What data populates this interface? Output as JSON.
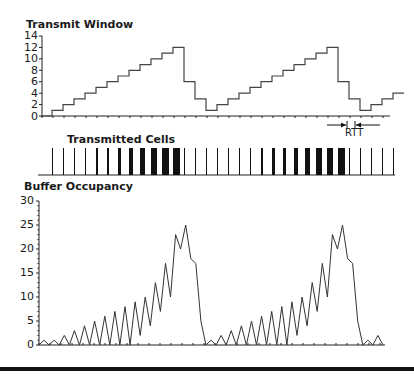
{
  "chart_data": [
    {
      "type": "line",
      "title": "Transmit Window",
      "ylabel": "",
      "xlabel": "",
      "ylim": [
        0,
        14
      ],
      "yticks": [
        0,
        2,
        4,
        6,
        8,
        10,
        12,
        14
      ],
      "series": [
        {
          "name": "Transmit Window",
          "step": true,
          "values": [
            0,
            1,
            2,
            3,
            4,
            5,
            6,
            7,
            8,
            9,
            10,
            11,
            12,
            6,
            3,
            1,
            2,
            3,
            4,
            5,
            6,
            7,
            8,
            9,
            10,
            11,
            12,
            6,
            3,
            1,
            2,
            3,
            4
          ]
        }
      ]
    },
    {
      "type": "bar",
      "title": "Transmitted Cells",
      "description": "Vertical bars representing cell transmissions; bar thickness grows with window size",
      "bar_widths": [
        1,
        1,
        1,
        1,
        2,
        2,
        3,
        4,
        5,
        6,
        7,
        7,
        1,
        1,
        1,
        1,
        1,
        1,
        1,
        2,
        3,
        3,
        4,
        5,
        6,
        6,
        7,
        1,
        1,
        1,
        1,
        1
      ]
    },
    {
      "type": "line",
      "title": "Buffer Occupancy",
      "ylim": [
        0,
        30
      ],
      "yticks": [
        0,
        5,
        10,
        15,
        20,
        25,
        30
      ],
      "series": [
        {
          "name": "Buffer Occupancy",
          "values": [
            0,
            1,
            0,
            1,
            0,
            2,
            0,
            3,
            0,
            4,
            0,
            5,
            0,
            6,
            0,
            7,
            0,
            8,
            0,
            9,
            2,
            10,
            4,
            13,
            7,
            17,
            10,
            23,
            20,
            25,
            18,
            17,
            5,
            0,
            1,
            0,
            2,
            0,
            3,
            0,
            4,
            0,
            5,
            0,
            6,
            0,
            7,
            0,
            8,
            0,
            9,
            2,
            10,
            4,
            13,
            7,
            17,
            10,
            23,
            20,
            25,
            18,
            17,
            5,
            0,
            1,
            0,
            2,
            0
          ]
        }
      ]
    }
  ],
  "labels": {
    "transmit_title": "Transmit Window",
    "cells_title": "Transmitted Cells",
    "buffer_title": "Buffer Occupancy",
    "rtt": "RTT"
  },
  "axes": {
    "window_ticks": [
      "14",
      "12",
      "10",
      "8",
      "6",
      "4",
      "2",
      "0"
    ],
    "buffer_ticks": [
      "30",
      "25",
      "20",
      "15",
      "10",
      "5",
      "0"
    ]
  }
}
